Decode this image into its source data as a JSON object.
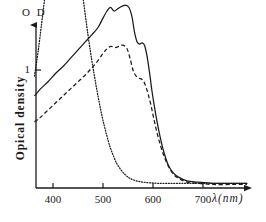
{
  "chart_data": {
    "type": "line",
    "title": "",
    "subtitle": "",
    "xlabel": "λ(nm)",
    "ylabel": "Opical density",
    "y_axis_top_label": "O D",
    "xlim": [
      360,
      790
    ],
    "ylim": [
      0,
      2.35
    ],
    "grid": false,
    "legend_position": "none",
    "xticks": [
      400,
      500,
      600,
      700
    ],
    "xtick_labels": [
      "400",
      "500",
      "600",
      "700"
    ],
    "yticks": [
      1
    ],
    "ytick_labels": [
      "1"
    ],
    "series": [
      {
        "name": "dotted-peak-curve",
        "style": "dotted",
        "x": [
          363,
          370,
          378,
          386,
          394,
          402,
          410,
          418,
          426,
          434,
          442,
          450,
          458,
          466,
          474,
          482,
          490,
          498,
          506,
          514,
          522,
          530,
          545,
          560,
          580,
          610,
          650,
          700,
          760,
          788
        ],
        "y": [
          0.95,
          1.15,
          1.42,
          1.7,
          1.96,
          2.14,
          2.27,
          2.33,
          2.33,
          2.26,
          2.12,
          1.92,
          1.68,
          1.42,
          1.18,
          0.97,
          0.78,
          0.61,
          0.47,
          0.35,
          0.26,
          0.19,
          0.11,
          0.07,
          0.05,
          0.04,
          0.04,
          0.04,
          0.04,
          0.04
        ]
      },
      {
        "name": "solid-curve",
        "style": "solid",
        "x": [
          363,
          375,
          390,
          405,
          420,
          435,
          450,
          465,
          478,
          490,
          500,
          508,
          515,
          522,
          530,
          538,
          545,
          552,
          558,
          563,
          568,
          573,
          578,
          583,
          588,
          593,
          598,
          604,
          610,
          616,
          622,
          630,
          640,
          652,
          668,
          690,
          720,
          760,
          788
        ],
        "y": [
          0.78,
          0.84,
          0.9,
          0.97,
          1.03,
          1.1,
          1.17,
          1.24,
          1.3,
          1.36,
          1.44,
          1.5,
          1.53,
          1.5,
          1.52,
          1.54,
          1.55,
          1.53,
          1.45,
          1.32,
          1.24,
          1.22,
          1.23,
          1.21,
          1.12,
          0.98,
          0.82,
          0.66,
          0.52,
          0.4,
          0.3,
          0.2,
          0.13,
          0.09,
          0.06,
          0.05,
          0.04,
          0.04,
          0.04
        ]
      },
      {
        "name": "dashed-curve",
        "style": "dashed",
        "x": [
          363,
          375,
          390,
          405,
          420,
          435,
          450,
          465,
          478,
          490,
          500,
          508,
          516,
          524,
          532,
          540,
          548,
          554,
          560,
          566,
          572,
          578,
          584,
          590,
          596,
          602,
          608,
          615,
          622,
          630,
          640,
          652,
          668,
          690,
          720,
          760,
          788
        ],
        "y": [
          0.56,
          0.6,
          0.66,
          0.72,
          0.78,
          0.84,
          0.9,
          0.96,
          1.02,
          1.08,
          1.14,
          1.18,
          1.2,
          1.19,
          1.2,
          1.21,
          1.18,
          1.1,
          1.0,
          0.95,
          0.93,
          0.92,
          0.88,
          0.8,
          0.7,
          0.58,
          0.47,
          0.36,
          0.27,
          0.19,
          0.12,
          0.08,
          0.05,
          0.04,
          0.03,
          0.03,
          0.03
        ]
      }
    ]
  },
  "style": {
    "line_color": "#1a1a1a",
    "axis_color": "#1a1a1a",
    "background": "#ffffff"
  },
  "geometry": {
    "origin_x": 36,
    "origin_y": 188,
    "x_axis_end": 252,
    "y_axis_top": 18,
    "px_per_100nm": 50,
    "y_one_px": 70
  }
}
